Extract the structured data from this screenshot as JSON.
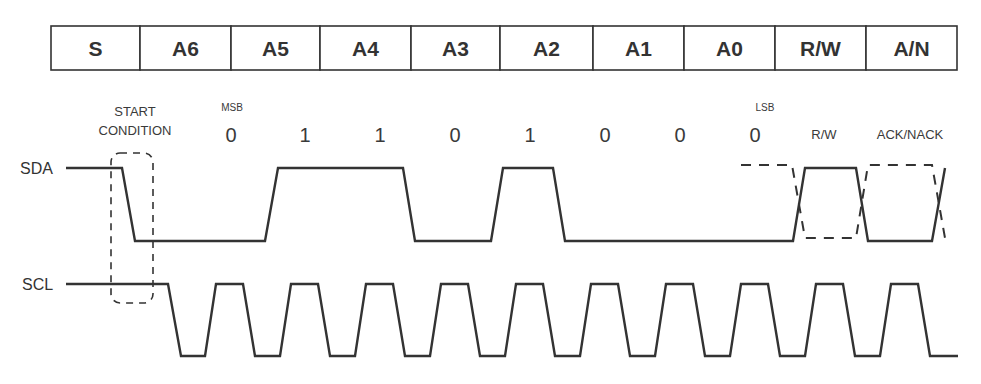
{
  "colors": {
    "ink": "#333333",
    "background": "#ffffff"
  },
  "bit_table": {
    "cells": [
      {
        "label": "S",
        "x": 51,
        "w": 89
      },
      {
        "label": "A6",
        "x": 140,
        "w": 91
      },
      {
        "label": "A5",
        "x": 231,
        "w": 89
      },
      {
        "label": "A4",
        "x": 320,
        "w": 91
      },
      {
        "label": "A3",
        "x": 411,
        "w": 89
      },
      {
        "label": "A2",
        "x": 500,
        "w": 93
      },
      {
        "label": "A1",
        "x": 593,
        "w": 91
      },
      {
        "label": "A0",
        "x": 684,
        "w": 91
      },
      {
        "label": "R/W",
        "x": 775,
        "w": 91
      },
      {
        "label": "A/N",
        "x": 866,
        "w": 91
      }
    ]
  },
  "annotations": {
    "start_line1": "START",
    "start_line2": "CONDITION",
    "msb": "MSB",
    "lsb": "LSB",
    "rw": "R/W",
    "ack_nack": "ACK/NACK"
  },
  "bits": [
    {
      "value": "0",
      "x": 231
    },
    {
      "value": "1",
      "x": 305
    },
    {
      "value": "1",
      "x": 380
    },
    {
      "value": "0",
      "x": 455
    },
    {
      "value": "1",
      "x": 530
    },
    {
      "value": "0",
      "x": 605
    },
    {
      "value": "0",
      "x": 680
    },
    {
      "value": "0",
      "x": 755
    }
  ],
  "signals": {
    "sda": {
      "label": "SDA",
      "high_y": 168,
      "low_y": 241,
      "points": "66,168 122,168 135,241 265,241 278,168 403,168 415,241 491,241 503,168 553,168 565,241 793,241 805,168 856,168 868,241 932,241 945,168",
      "dashed_points": "741,165 792,165 805,238 856,238 868,165 932,165 945,238"
    },
    "scl": {
      "label": "SCL",
      "high_y": 284,
      "low_y": 356,
      "start_x": 66,
      "first_fall_x": 168,
      "period": 75,
      "pulses": 10,
      "end_x": 958
    }
  }
}
